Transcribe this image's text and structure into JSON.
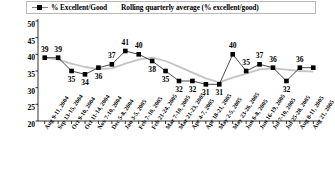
{
  "legend": {
    "entries": [
      {
        "label": "% Excellent/Good",
        "marker": "square-marker-icon",
        "color": "#000000"
      },
      {
        "label": "Rolling quarterly average (% excellent/good)",
        "marker": "line-swatch-icon",
        "color": "#bfbfbf"
      }
    ]
  },
  "chart_data": {
    "type": "line",
    "title": "",
    "subtitle": "",
    "xlabel": "",
    "ylabel": "",
    "ylim": [
      20,
      50
    ],
    "yticks": [
      20,
      25,
      30,
      35,
      40,
      45,
      50
    ],
    "grid": false,
    "legend_position": "top",
    "categories": [
      "Aug 9-11, 2004",
      "Sep 13-15, 2004",
      "Oct 9-10, 2004",
      "Oct 11-14, 2004",
      "Nov 7-10, 2004",
      "Dec 5-8, 2004",
      "Jan 3-5, 2005",
      "Feb 7-10, 2005",
      "Feb 21-24, 2005",
      "Mar 7-10, 2005",
      "Mar 21-23, 2005",
      "Apr 4-7, 2005",
      "Apr 18-21, 2005",
      "May 2-5, 2005",
      "May 23-26, 2005",
      "Jun 6-8, 2005",
      "Jun 16-19, 2005",
      "Jul 7-10, 2005",
      "Jul 25-28, 2005",
      "Aug 8-11, 2005",
      "Aug 21, 2005"
    ],
    "series": [
      {
        "name": "% Excellent/Good",
        "color": "#000000",
        "marker": "square",
        "show_labels": true,
        "values": [
          39,
          39,
          35,
          34,
          36,
          37,
          41,
          40,
          38,
          35,
          32,
          32,
          31,
          31,
          40,
          35,
          37,
          36,
          32,
          36,
          36
        ]
      },
      {
        "name": "Rolling quarterly average (% excellent/good)",
        "color": "#c4c4c4",
        "marker": "none",
        "show_labels": false,
        "values": [
          39.0,
          38.4,
          37.2,
          36.2,
          35.6,
          35.8,
          37.2,
          38.4,
          39.0,
          38.0,
          36.3,
          34.5,
          32.8,
          31.6,
          33.0,
          34.2,
          35.5,
          35.8,
          35.4,
          35.0,
          34.8
        ]
      }
    ],
    "point_labels": [
      {
        "value": 39,
        "pos": "above"
      },
      {
        "value": 39,
        "pos": "above"
      },
      {
        "value": 35,
        "pos": "below"
      },
      {
        "value": 34,
        "pos": "below"
      },
      {
        "value": 36,
        "pos": "below"
      },
      {
        "value": 37,
        "pos": "above"
      },
      {
        "value": 41,
        "pos": "above"
      },
      {
        "value": 40,
        "pos": "above"
      },
      {
        "value": 38,
        "pos": "below"
      },
      {
        "value": 35,
        "pos": "below"
      },
      {
        "value": 32,
        "pos": "below"
      },
      {
        "value": 32,
        "pos": "below"
      },
      {
        "value": 31,
        "pos": "below"
      },
      {
        "value": 31,
        "pos": "below"
      },
      {
        "value": 40,
        "pos": "above"
      },
      {
        "value": 35,
        "pos": "above"
      },
      {
        "value": 37,
        "pos": "above"
      },
      {
        "value": 36,
        "pos": "above"
      },
      {
        "value": 32,
        "pos": "below"
      },
      {
        "value": 36,
        "pos": "above"
      },
      {
        "value": null,
        "pos": "none"
      }
    ]
  }
}
